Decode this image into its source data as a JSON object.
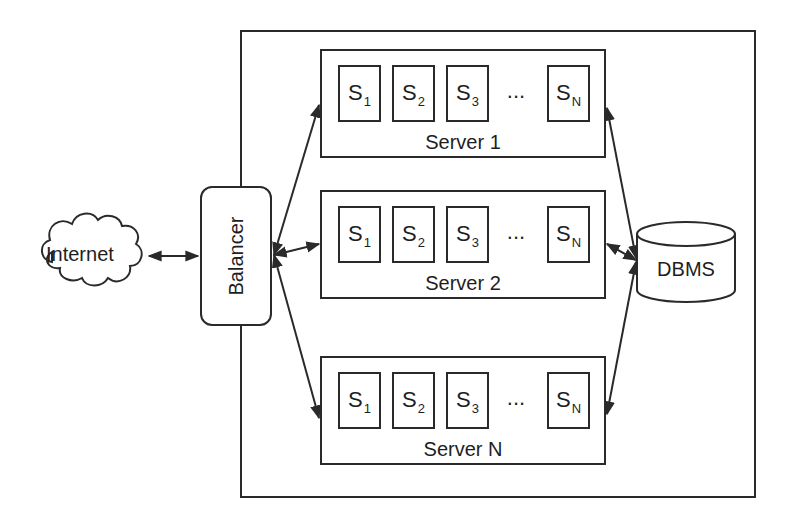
{
  "diagram": {
    "internet": {
      "label": "Internet",
      "icon": "cloud-icon"
    },
    "balancer": {
      "label": "Balancer"
    },
    "dbms": {
      "label": "DBMS",
      "icon": "database-cylinder-icon"
    },
    "servers": [
      {
        "label": "Server 1",
        "slots": [
          {
            "base": "S",
            "sub": "1"
          },
          {
            "base": "S",
            "sub": "2"
          },
          {
            "base": "S",
            "sub": "3"
          },
          {
            "base": "S",
            "sub": "N"
          }
        ],
        "ellipsis": "..."
      },
      {
        "label": "Server 2",
        "slots": [
          {
            "base": "S",
            "sub": "1"
          },
          {
            "base": "S",
            "sub": "2"
          },
          {
            "base": "S",
            "sub": "3"
          },
          {
            "base": "S",
            "sub": "N"
          }
        ],
        "ellipsis": "..."
      },
      {
        "label": "Server N",
        "slots": [
          {
            "base": "S",
            "sub": "1"
          },
          {
            "base": "S",
            "sub": "2"
          },
          {
            "base": "S",
            "sub": "3"
          },
          {
            "base": "S",
            "sub": "N"
          }
        ],
        "ellipsis": "..."
      }
    ],
    "connections": [
      {
        "from": "Internet",
        "to": "Balancer",
        "type": "bidirectional"
      },
      {
        "from": "Balancer",
        "to": "Server 1",
        "type": "bidirectional"
      },
      {
        "from": "Balancer",
        "to": "Server 2",
        "type": "bidirectional"
      },
      {
        "from": "Balancer",
        "to": "Server N",
        "type": "bidirectional"
      },
      {
        "from": "Server 1",
        "to": "DBMS",
        "type": "bidirectional"
      },
      {
        "from": "Server 2",
        "to": "DBMS",
        "type": "bidirectional"
      },
      {
        "from": "Server N",
        "to": "DBMS",
        "type": "bidirectional"
      }
    ],
    "colors": {
      "stroke": "#2a2a2a",
      "background": "#ffffff",
      "text": "#1e1e1e"
    }
  }
}
